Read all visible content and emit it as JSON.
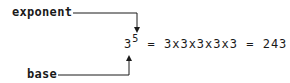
{
  "labels": {
    "exponent": "exponent",
    "base": "base"
  },
  "equation": {
    "base": "3",
    "exponent": "5",
    "equals1": " = ",
    "expansion": "3x3x3x3x3",
    "equals2": " = ",
    "result": "243"
  },
  "colors": {
    "ink": "#1a1a1a",
    "background": "#ffffff"
  }
}
